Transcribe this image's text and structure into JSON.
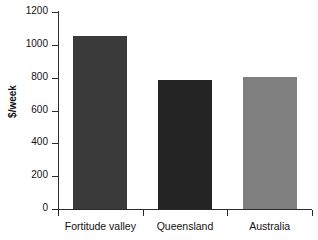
{
  "chart_data": {
    "type": "bar",
    "title": "",
    "xlabel": "",
    "ylabel": "$/week",
    "categories": [
      "Fortitude valley",
      "Queensland",
      "Australia"
    ],
    "values": [
      1055,
      785,
      805
    ],
    "series": [
      {
        "name": "Median rent",
        "values": [
          1055,
          785,
          805
        ]
      }
    ],
    "bar_colors": [
      "#3a3a3a",
      "#242424",
      "#808080"
    ],
    "ylim": [
      0,
      1200
    ],
    "yticks": [
      0,
      200,
      400,
      600,
      800,
      1000,
      1200
    ],
    "ytick_labels": [
      "0",
      "200",
      "400",
      "600",
      "800",
      "1000",
      "1200"
    ],
    "grid": false,
    "legend": "none",
    "axis_color": "#2b2b2b",
    "background": "#ffffff"
  }
}
